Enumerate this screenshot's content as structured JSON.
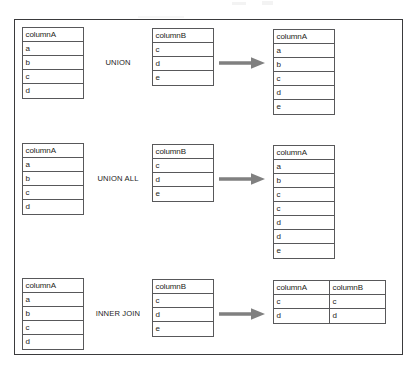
{
  "diagram": {
    "title_visible": false,
    "colors": {
      "frame_border": "#3a3a3c",
      "table_border": "#58585a",
      "arrow": "#808080",
      "text": "#1e1e20",
      "background": "#ffffff"
    },
    "arrow_icon_name": "right-arrow-icon",
    "rows": [
      {
        "operator": "UNION",
        "left_table": {
          "header": "columnA",
          "values": [
            "a",
            "b",
            "c",
            "d"
          ]
        },
        "right_table": {
          "header": "columnB",
          "values": [
            "c",
            "d",
            "e"
          ]
        },
        "result_table": {
          "headers": [
            "columnA"
          ],
          "rows": [
            [
              "a"
            ],
            [
              "b"
            ],
            [
              "c"
            ],
            [
              "d"
            ],
            [
              "e"
            ]
          ]
        }
      },
      {
        "operator": "UNION ALL",
        "left_table": {
          "header": "columnA",
          "values": [
            "a",
            "b",
            "c",
            "d"
          ]
        },
        "right_table": {
          "header": "columnB",
          "values": [
            "c",
            "d",
            "e"
          ]
        },
        "result_table": {
          "headers": [
            "columnA"
          ],
          "rows": [
            [
              "a"
            ],
            [
              "b"
            ],
            [
              "c"
            ],
            [
              "c"
            ],
            [
              "d"
            ],
            [
              "d"
            ],
            [
              "e"
            ]
          ]
        }
      },
      {
        "operator": "INNER JOIN",
        "left_table": {
          "header": "columnA",
          "values": [
            "a",
            "b",
            "c",
            "d"
          ]
        },
        "right_table": {
          "header": "columnB",
          "values": [
            "c",
            "d",
            "e"
          ]
        },
        "result_table": {
          "headers": [
            "columnA",
            "columnB"
          ],
          "rows": [
            [
              "c",
              "c"
            ],
            [
              "d",
              "d"
            ]
          ]
        }
      }
    ]
  }
}
